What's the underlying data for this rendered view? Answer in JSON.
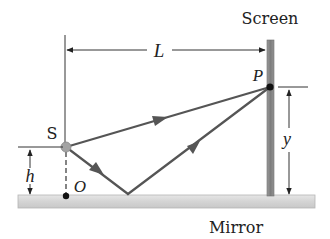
{
  "figure": {
    "labels": {
      "screen": "Screen",
      "mirror": "Mirror",
      "source": "S",
      "point_p": "P",
      "origin": "O",
      "distance_L": "L",
      "height_h": "h",
      "height_y": "y"
    },
    "colors": {
      "ray": "#555555",
      "screen_bar": "#8a8a8a",
      "mirror_bar": "#d8d8d8",
      "source_dot": "#a0a0a0",
      "point_dot": "#111111",
      "line": "#333333"
    },
    "elements": {
      "source": {
        "x": 66,
        "y": 147
      },
      "point_p": {
        "x": 270,
        "y": 87
      },
      "origin": {
        "x": 66,
        "y": 196
      },
      "reflection_point": {
        "x": 128,
        "y": 194
      },
      "screen_bar": {
        "x": 267,
        "y": 40,
        "width": 7,
        "height": 156
      },
      "mirror_bar": {
        "x": 18,
        "y": 195,
        "width": 297,
        "height": 13
      }
    }
  }
}
